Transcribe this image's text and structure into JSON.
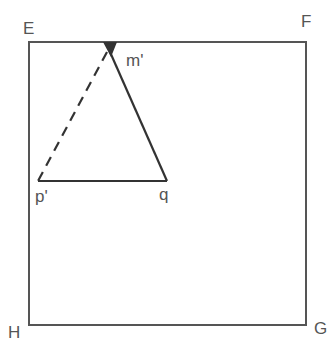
{
  "diagram": {
    "labels": {
      "E": "E",
      "F": "F",
      "G": "G",
      "H": "H",
      "m": "m'",
      "p": "p'",
      "q": "q"
    },
    "colors": {
      "frame": "#555555",
      "triangle": "#333333",
      "label": "#555555"
    }
  }
}
